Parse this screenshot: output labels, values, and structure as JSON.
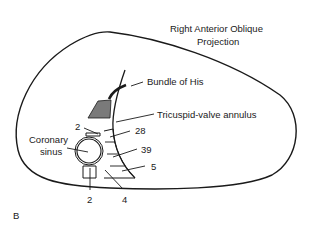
{
  "figure": {
    "title_line1": "Right Anterior Oblique",
    "title_line2": "Projection",
    "panel_label": "B"
  },
  "labels": {
    "bundle_of_his": "Bundle of His",
    "tricuspid_annulus": "Tricuspid-valve annulus",
    "coronary_sinus_line1": "Coronary",
    "coronary_sinus_line2": "sinus",
    "count_top_left": "2",
    "count_28": "28",
    "count_39": "39",
    "count_5": "5",
    "count_bottom_left": "2",
    "count_4": "4"
  },
  "colors": {
    "line": "#1a1a1a",
    "shaded_region": "#7a7a7a",
    "background": "#ffffff"
  }
}
